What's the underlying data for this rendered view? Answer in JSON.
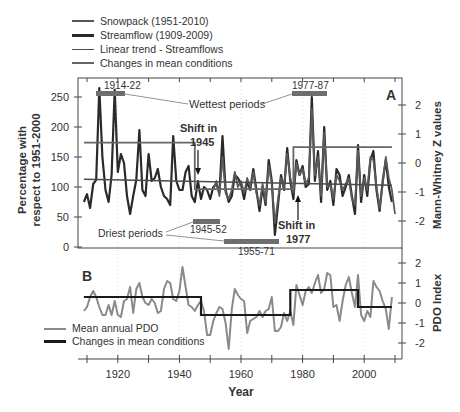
{
  "chart_data": [
    {
      "panel": "A",
      "type": "line",
      "title": "",
      "xlabel": "Year",
      "ylabel": "Percentage with respect to 1951-2000",
      "y2label": "Mann-Whitney Z values",
      "xlim": [
        1908,
        2012
      ],
      "ylim": [
        0,
        275
      ],
      "y2lim": [
        -2.5,
        2.5
      ],
      "yticks": [
        0,
        50,
        100,
        150,
        200,
        250
      ],
      "y2ticks": [
        -2,
        -1,
        0,
        1,
        2
      ],
      "xticks": [
        1920,
        1940,
        1960,
        1980,
        2000
      ],
      "legend": [
        {
          "label": "Snowpack (1951-2010)",
          "color": "#555555",
          "width": 2
        },
        {
          "label": "Streamflow (1909-2009)",
          "color": "#2a2a2a",
          "width": 3
        },
        {
          "label": "Linear trend  - Streamflows",
          "color": "#4a4a4a",
          "width": 1.5
        },
        {
          "label": "Changes in mean conditions",
          "color": "#666666",
          "width": 2
        }
      ],
      "series": [
        {
          "name": "Streamflow (1909-2009)",
          "x": [
            1909,
            1910,
            1911,
            1912,
            1913,
            1914,
            1915,
            1916,
            1917,
            1918,
            1919,
            1920,
            1921,
            1922,
            1923,
            1924,
            1925,
            1926,
            1927,
            1928,
            1929,
            1930,
            1931,
            1932,
            1933,
            1934,
            1935,
            1936,
            1937,
            1938,
            1939,
            1940,
            1941,
            1942,
            1943,
            1944,
            1945,
            1946,
            1947,
            1948,
            1949,
            1950,
            1951,
            1952,
            1953,
            1954,
            1955,
            1956,
            1957,
            1958,
            1959,
            1960,
            1961,
            1962,
            1963,
            1964,
            1965,
            1966,
            1967,
            1968,
            1969,
            1970,
            1971,
            1972,
            1973,
            1974,
            1975,
            1976,
            1977,
            1978,
            1979,
            1980,
            1981,
            1982,
            1983,
            1984,
            1985,
            1986,
            1987,
            1988,
            1989,
            1990,
            1991,
            1992,
            1993,
            1994,
            1995,
            1996,
            1997,
            1998,
            1999,
            2000,
            2001,
            2002,
            2003,
            2004,
            2005,
            2006,
            2007,
            2008,
            2009
          ],
          "values": [
            75,
            88,
            65,
            105,
            112,
            265,
            150,
            95,
            75,
            120,
            262,
            125,
            155,
            140,
            85,
            55,
            85,
            112,
            195,
            95,
            85,
            155,
            110,
            115,
            130,
            100,
            85,
            80,
            70,
            185,
            110,
            95,
            95,
            125,
            135,
            85,
            75,
            110,
            80,
            100,
            95,
            80,
            100,
            105,
            90,
            185,
            95,
            75,
            85,
            120,
            115,
            105,
            80,
            110,
            95,
            130,
            95,
            60,
            100,
            70,
            145,
            110,
            20,
            70,
            120,
            95,
            165,
            110,
            80,
            145,
            120,
            135,
            100,
            105,
            250,
            110,
            160,
            75,
            200,
            95,
            110,
            70,
            130,
            120,
            85,
            100,
            120,
            85,
            55,
            170,
            75,
            120,
            85,
            145,
            160,
            95,
            60,
            110,
            145,
            100,
            75
          ]
        },
        {
          "name": "Snowpack (1951-2010)",
          "x": [
            1951,
            1952,
            1953,
            1954,
            1955,
            1956,
            1957,
            1958,
            1959,
            1960,
            1961,
            1962,
            1963,
            1964,
            1965,
            1966,
            1967,
            1968,
            1969,
            1970,
            1971,
            1972,
            1973,
            1974,
            1975,
            1976,
            1977,
            1978,
            1979,
            1980,
            1981,
            1982,
            1983,
            1984,
            1985,
            1986,
            1987,
            1988,
            1989,
            1990,
            1991,
            1992,
            1993,
            1994,
            1995,
            1996,
            1997,
            1998,
            1999,
            2000,
            2001,
            2002,
            2003,
            2004,
            2005,
            2006,
            2007,
            2008,
            2009,
            2010
          ],
          "values": [
            95,
            110,
            85,
            150,
            90,
            80,
            95,
            125,
            100,
            110,
            90,
            115,
            100,
            125,
            90,
            70,
            105,
            75,
            135,
            105,
            40,
            80,
            115,
            100,
            155,
            115,
            90,
            140,
            120,
            130,
            105,
            115,
            230,
            120,
            150,
            85,
            190,
            100,
            105,
            80,
            120,
            110,
            95,
            105,
            115,
            80,
            70,
            160,
            85,
            115,
            95,
            150,
            145,
            100,
            65,
            105,
            150,
            115,
            95,
            55
          ]
        },
        {
          "name": "Linear trend - Streamflows",
          "x": [
            1909,
            2009
          ],
          "values": [
            113,
            103
          ]
        },
        {
          "name": "Changes in mean conditions (Z values)",
          "x": [
            1909,
            1945,
            1945,
            1977,
            1977,
            2009
          ],
          "values": [
            0.7,
            0.7,
            -0.9,
            -0.9,
            0.55,
            0.55
          ]
        }
      ],
      "annotations": [
        {
          "text": "Wettest periods",
          "periods": [
            "1914-22",
            "1977-87"
          ]
        },
        {
          "text": "Driest periods",
          "periods": [
            "1945-52",
            "1955-71"
          ]
        },
        {
          "text": "Shift in 1945",
          "x": 1945
        },
        {
          "text": "Shift in 1977",
          "x": 1977
        },
        {
          "text": "A"
        }
      ],
      "grid": "vertical dotted at decades"
    },
    {
      "panel": "B",
      "type": "line",
      "xlabel": "Year",
      "y2label": "PDO Index",
      "xlim": [
        1908,
        2012
      ],
      "y2lim": [
        -2.7,
        2.7
      ],
      "y2ticks": [
        -2,
        -1,
        0,
        1,
        2
      ],
      "xticks": [
        1920,
        1940,
        1960,
        1980,
        2000
      ],
      "legend": [
        {
          "label": "Mean annual PDO",
          "color": "#8a8a8a",
          "width": 2
        },
        {
          "label": "Changes in mean conditions",
          "color": "#1a1a1a",
          "width": 2.5
        }
      ],
      "series": [
        {
          "name": "Mean annual PDO",
          "x": [
            1909,
            1910,
            1911,
            1912,
            1913,
            1914,
            1915,
            1916,
            1917,
            1918,
            1919,
            1920,
            1921,
            1922,
            1923,
            1924,
            1925,
            1926,
            1927,
            1928,
            1929,
            1930,
            1931,
            1932,
            1933,
            1934,
            1935,
            1936,
            1937,
            1938,
            1939,
            1940,
            1941,
            1942,
            1943,
            1944,
            1945,
            1946,
            1947,
            1948,
            1949,
            1950,
            1951,
            1952,
            1953,
            1954,
            1955,
            1956,
            1957,
            1958,
            1959,
            1960,
            1961,
            1962,
            1963,
            1964,
            1965,
            1966,
            1967,
            1968,
            1969,
            1970,
            1971,
            1972,
            1973,
            1974,
            1975,
            1976,
            1977,
            1978,
            1979,
            1980,
            1981,
            1982,
            1983,
            1984,
            1985,
            1986,
            1987,
            1988,
            1989,
            1990,
            1991,
            1992,
            1993,
            1994,
            1995,
            1996,
            1997,
            1998,
            1999,
            2000,
            2001,
            2002,
            2003,
            2004,
            2005,
            2006,
            2007,
            2008,
            2009
          ],
          "values": [
            -0.4,
            -0.2,
            0.3,
            0.6,
            0.3,
            -0.2,
            -0.6,
            -0.6,
            -0.1,
            -0.6,
            0.1,
            -0.6,
            -0.7,
            0.1,
            0.2,
            0.8,
            -0.5,
            0.7,
            1.0,
            0.3,
            0.0,
            -0.1,
            0.2,
            0.0,
            -0.5,
            -0.4,
            0.7,
            1.1,
            1.0,
            0.2,
            0.1,
            0.6,
            1.8,
            0.8,
            -0.1,
            -0.2,
            -0.4,
            -0.1,
            0.1,
            -0.4,
            -1.6,
            -1.6,
            -0.9,
            -0.5,
            -0.2,
            -0.3,
            -1.0,
            -2.3,
            -0.3,
            0.7,
            0.4,
            0.2,
            0.1,
            -1.5,
            -0.9,
            -0.8,
            -0.7,
            -0.4,
            -0.7,
            -0.4,
            -0.3,
            0.3,
            -1.4,
            -1.4,
            -1.2,
            -0.5,
            -0.9,
            -0.4,
            -1.1,
            0.9,
            0.4,
            -0.1,
            0.6,
            0.8,
            0.5,
            1.0,
            1.4,
            0.5,
            0.7,
            1.5,
            1.4,
            -0.2,
            -0.1,
            -0.9,
            0.1,
            0.9,
            1.3,
            0.5,
            -0.2,
            1.4,
            -0.6,
            -0.9,
            -0.4,
            -0.7,
            1.1,
            0.8,
            0.6,
            0.1,
            -0.3,
            -1.3,
            0.3
          ]
        },
        {
          "name": "Changes in mean conditions",
          "x": [
            1909,
            1947,
            1947,
            1976,
            1976,
            1998,
            1998,
            2009
          ],
          "values": [
            0.3,
            0.3,
            -0.6,
            -0.6,
            0.65,
            0.65,
            -0.2,
            -0.2
          ]
        }
      ],
      "annotations": [
        {
          "text": "B"
        }
      ]
    }
  ],
  "legendA": {
    "items": [
      "Snowpack (1951-2010)",
      "Streamflow (1909-2009)",
      "Linear trend  - Streamflows",
      "Changes in mean conditions"
    ]
  },
  "legendB": {
    "items": [
      "Mean annual PDO",
      "Changes in mean conditions"
    ]
  },
  "labels": {
    "ylabel_line1": "Percentage with",
    "ylabel_line2": "respect to 1951-2000",
    "y2labelA": "Mann-Whitney Z values",
    "y2labelB": "PDO Index",
    "xlabel": "Year",
    "panelA": "A",
    "panelB": "B",
    "wettest": "Wettest periods",
    "driest": "Driest periods",
    "wet1": "1914-22",
    "wet2": "1977-87",
    "dry1": "1945-52",
    "dry2": "1955-71",
    "shift1945_l1": "Shift in",
    "shift1945_l2": "1945",
    "shift1977_l1": "Shift in",
    "shift1977_l2": "1977"
  }
}
